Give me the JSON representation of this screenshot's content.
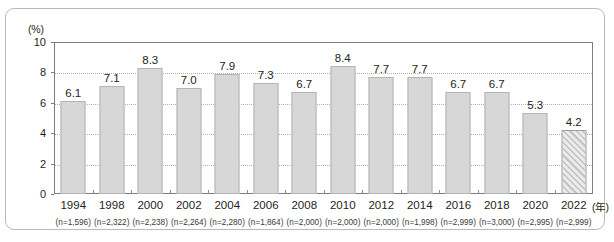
{
  "chart_data": {
    "type": "bar",
    "title": "",
    "subtitle": "",
    "unit_label": "(%)",
    "xlabel": "(年)",
    "ylabel": "",
    "ylim": [
      0,
      10
    ],
    "yticks": [
      0,
      2,
      4,
      6,
      8,
      10
    ],
    "grid": true,
    "gridlines_at": [
      2,
      4,
      6,
      8
    ],
    "legend": [],
    "categories": [
      "1994",
      "1998",
      "2000",
      "2002",
      "2004",
      "2006",
      "2008",
      "2010",
      "2012",
      "2014",
      "2016",
      "2018",
      "2020",
      "2022"
    ],
    "values": [
      6.1,
      7.1,
      8.3,
      7.0,
      7.9,
      7.3,
      6.7,
      8.4,
      7.7,
      7.7,
      6.7,
      6.7,
      5.3,
      4.2
    ],
    "data_labels": [
      "6.1",
      "7.1",
      "8.3",
      "7.0",
      "7.9",
      "7.3",
      "6.7",
      "8.4",
      "7.7",
      "7.7",
      "6.7",
      "6.7",
      "5.3",
      "4.2"
    ],
    "sample_sizes": [
      "(n=1,596)",
      "(n=2,322)",
      "(n=2,238)",
      "(n=2,264)",
      "(n=2,280)",
      "(n=1,864)",
      "(n=2,000)",
      "(n=2,000)",
      "(n=2,000)",
      "(n=1,998)",
      "(n=2,999)",
      "(n=3,000)",
      "(n=2,995)",
      "(n=2,999)"
    ],
    "bar_styles": [
      "solid",
      "solid",
      "solid",
      "solid",
      "solid",
      "solid",
      "solid",
      "solid",
      "solid",
      "solid",
      "solid",
      "solid",
      "solid",
      "hatched"
    ],
    "colors": {
      "bar_fill": "#d7d7d7",
      "bar_border": "#b4b4b4",
      "hatched_fill": "#c4c4c4",
      "hatched_border": "#9e9e9e",
      "axis": "#7d7d7d",
      "gridline": "#b0b0b0",
      "text": "#231f20",
      "frame_border": "#b9b9b9"
    }
  }
}
